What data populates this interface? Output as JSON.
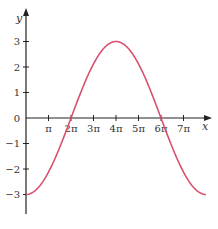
{
  "chart_data": {
    "type": "line",
    "title": "",
    "xlabel": "x",
    "ylabel": "y",
    "function": "y = -3cos(x/4)",
    "xlim": [
      0,
      8
    ],
    "x_unit": "pi",
    "ylim": [
      -4,
      3.5
    ],
    "grid": false,
    "legend": null,
    "x_ticks": [
      {
        "value": 1,
        "label": "π"
      },
      {
        "value": 2,
        "label": "2π"
      },
      {
        "value": 3,
        "label": "3π"
      },
      {
        "value": 4,
        "label": "4π"
      },
      {
        "value": 5,
        "label": "5π"
      },
      {
        "value": 6,
        "label": "6π"
      },
      {
        "value": 7,
        "label": "7π"
      }
    ],
    "y_ticks": [
      {
        "value": 3,
        "label": "3"
      },
      {
        "value": 2,
        "label": "2"
      },
      {
        "value": 1,
        "label": "1"
      },
      {
        "value": 0,
        "label": "0"
      },
      {
        "value": -1,
        "label": "−1"
      },
      {
        "value": -2,
        "label": "−2"
      },
      {
        "value": -3,
        "label": "−3"
      }
    ],
    "series": [
      {
        "name": "y = -3cos(x/4)",
        "color": "#d9506e",
        "x_pi": [
          0,
          1,
          2,
          3,
          4,
          5,
          6,
          7,
          8
        ],
        "values": [
          -3,
          -2.12,
          0,
          2.12,
          3,
          2.12,
          0,
          -2.12,
          -3
        ]
      }
    ]
  },
  "colors": {
    "axis": "#222222",
    "curve": "#d9506e",
    "text": "#333333"
  }
}
